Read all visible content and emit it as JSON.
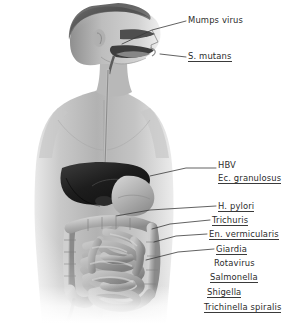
{
  "figure": {
    "style": "grayscale-photographic-illustration",
    "background_color": "#ffffff",
    "ink_color": "#2b2b2b",
    "organs": [
      "parotid-salivary-gland",
      "oral-cavity",
      "pharynx",
      "esophagus",
      "liver",
      "gallbladder",
      "stomach",
      "duodenum",
      "small-intestine",
      "large-intestine",
      "cecum",
      "appendix",
      "sigmoid-colon"
    ]
  },
  "labels": [
    {
      "id": "mumps",
      "text": "Mumps virus",
      "underline": false,
      "target": "parotid-salivary-gland",
      "x": 188,
      "y": 16
    },
    {
      "id": "s-mutans",
      "text": "S. mutans",
      "underline": true,
      "target": "oral-cavity",
      "x": 188,
      "y": 52
    },
    {
      "id": "hbv",
      "text": "HBV",
      "underline": false,
      "target": "liver",
      "x": 218,
      "y": 161
    },
    {
      "id": "ec-granulosus",
      "text": "Ec. granulosus",
      "underline": true,
      "target": "liver",
      "x": 218,
      "y": 174
    },
    {
      "id": "h-pylori",
      "text": "H. pylori",
      "underline": true,
      "target": "stomach",
      "x": 218,
      "y": 202
    },
    {
      "id": "trichuris",
      "text": "Trichuris",
      "underline": true,
      "target": "large-intestine",
      "x": 212,
      "y": 216
    },
    {
      "id": "en-verm",
      "text": "En. vermicularis",
      "underline": true,
      "target": "cecum",
      "x": 209,
      "y": 230
    },
    {
      "id": "giardia",
      "text": "Giardia",
      "underline": true,
      "target": "small-intestine",
      "x": 216,
      "y": 245
    },
    {
      "id": "rotavirus",
      "text": "Rotavirus",
      "underline": false,
      "target": "small-intestine",
      "x": 214,
      "y": 259
    },
    {
      "id": "salmonella",
      "text": "Salmonella",
      "underline": true,
      "target": "small-intestine",
      "x": 210,
      "y": 273
    },
    {
      "id": "shigella",
      "text": "Shigella",
      "underline": true,
      "target": "large-intestine",
      "x": 207,
      "y": 288
    },
    {
      "id": "trichinella",
      "text": "Trichinella spiralis",
      "underline": true,
      "target": "small-intestine",
      "x": 204,
      "y": 303
    }
  ]
}
